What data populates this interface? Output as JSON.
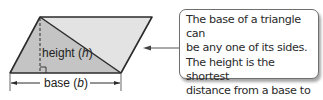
{
  "diagram": {
    "shape": "parallelogram",
    "labels": {
      "height": "height (",
      "height_var": "h",
      "height_close": ")",
      "base": "base (",
      "base_var": "b",
      "base_close": ")"
    },
    "colors": {
      "left_triangle": "#c4c4c4",
      "right_triangle": "#e3e3e3",
      "outline": "#2b2b2b"
    }
  },
  "callout": {
    "text": "The base of a triangle can\nbe any one of its sides.\nThe height is the shortest\ndistance from a base to\nthe opposite vertex."
  }
}
